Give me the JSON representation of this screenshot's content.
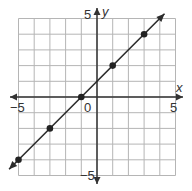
{
  "chart_data": {
    "type": "line",
    "title": "",
    "xlabel": "x",
    "ylabel": "y",
    "xlim": [
      -5,
      5
    ],
    "ylim": [
      -5,
      5
    ],
    "grid": true,
    "x_tick_labels": [
      "-5",
      "0",
      "5"
    ],
    "y_tick_labels": [
      "5",
      "-5"
    ],
    "equation": "y = x + 1",
    "points": [
      {
        "x": -5,
        "y": -4
      },
      {
        "x": -3,
        "y": -2
      },
      {
        "x": -1,
        "y": 0
      },
      {
        "x": 1,
        "y": 2
      },
      {
        "x": 3,
        "y": 4
      }
    ],
    "line_extends_with_arrows": true
  },
  "labels": {
    "x_axis": "x",
    "y_axis": "y",
    "x_min": "−5",
    "x_max": "5",
    "y_max": "5",
    "y_min": "−5",
    "origin": "0"
  },
  "colors": {
    "grid": "#b5b5b5",
    "axis": "#333333",
    "line": "#2b2b2b",
    "point": "#222222"
  }
}
